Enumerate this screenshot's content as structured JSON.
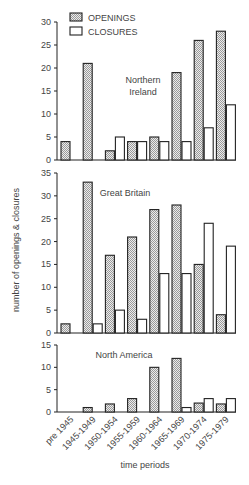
{
  "chart_data": [
    {
      "type": "bar",
      "title": "Northern Ireland",
      "categories": [
        "pre 1945",
        "1945-1949",
        "1950-1954",
        "1955-1959",
        "1960-1964",
        "1965-1969",
        "1970-1974",
        "1975-1979"
      ],
      "series": [
        {
          "name": "OPENINGS",
          "values": [
            4,
            21,
            2,
            4,
            5,
            19,
            26,
            28
          ]
        },
        {
          "name": "CLOSURES",
          "values": [
            0,
            0,
            5,
            4,
            4,
            4,
            7,
            12
          ]
        }
      ],
      "ylim": [
        0,
        30
      ],
      "yticks": [
        0,
        5,
        10,
        15,
        20,
        25,
        30
      ],
      "legend_position": "top-left"
    },
    {
      "type": "bar",
      "title": "Great Britain",
      "categories": [
        "pre 1945",
        "1945-1949",
        "1950-1954",
        "1955-1959",
        "1960-1964",
        "1965-1969",
        "1970-1974",
        "1975-1979"
      ],
      "series": [
        {
          "name": "OPENINGS",
          "values": [
            2,
            33,
            17,
            21,
            27,
            28,
            15,
            4
          ]
        },
        {
          "name": "CLOSURES",
          "values": [
            0,
            2,
            5,
            3,
            13,
            13,
            24,
            19
          ]
        }
      ],
      "ylim": [
        0,
        35
      ],
      "yticks": [
        0,
        5,
        10,
        15,
        20,
        25,
        30,
        35
      ]
    },
    {
      "type": "bar",
      "title": "North America",
      "categories": [
        "pre 1945",
        "1945-1949",
        "1950-1954",
        "1955-1959",
        "1960-1964",
        "1965-1969",
        "1970-1974",
        "1975-1979"
      ],
      "series": [
        {
          "name": "OPENINGS",
          "values": [
            0,
            1,
            1.8,
            3,
            10,
            12,
            2,
            1.8
          ]
        },
        {
          "name": "CLOSURES",
          "values": [
            0,
            0,
            0,
            0,
            0,
            1,
            3,
            3
          ]
        }
      ],
      "ylim": [
        0,
        15
      ],
      "yticks": [
        0,
        5,
        10,
        15
      ]
    }
  ],
  "legend": {
    "openings": "OPENINGS",
    "closures": "CLOSURES"
  },
  "xlabel": "time periods",
  "ylabel": "number of openings & closures",
  "panels": [
    {
      "title_line1": "Northern",
      "title_line2": "Ireland"
    },
    {
      "title_line1": "Great Britain",
      "title_line2": ""
    },
    {
      "title_line1": "North America",
      "title_line2": ""
    }
  ],
  "colors": {
    "openings_fill": "#d9d9d9",
    "closures_fill": "#ffffff",
    "stroke": "#222222"
  }
}
